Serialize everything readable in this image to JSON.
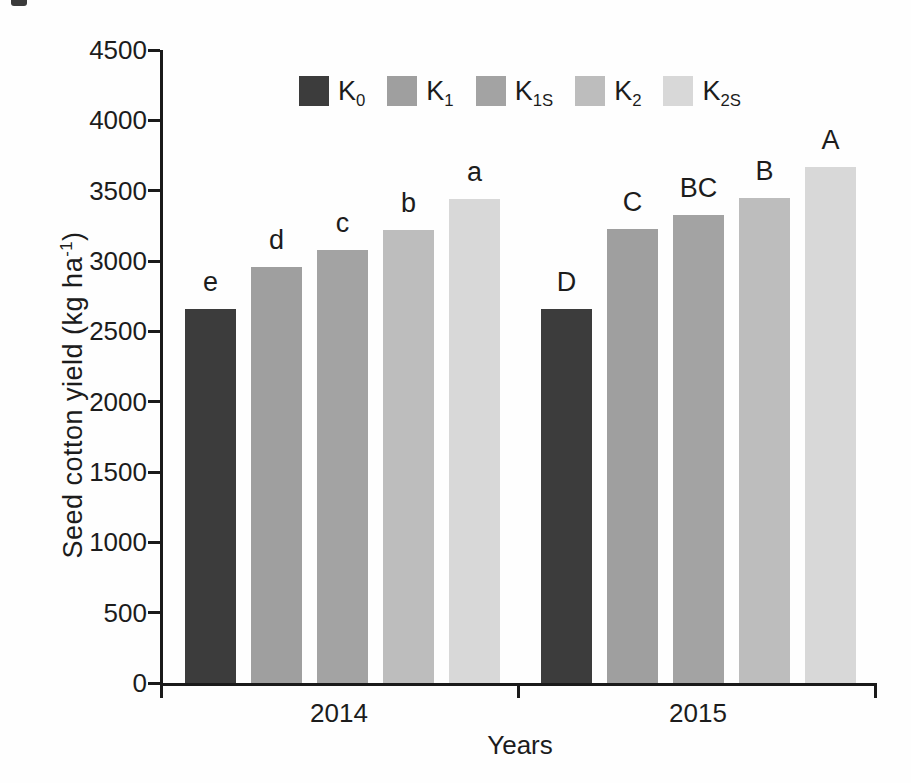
{
  "chart_data": {
    "type": "bar",
    "title": "",
    "xlabel": "Years",
    "ylabel_prefix": "Seed cotton yield (kg ha",
    "ylabel_sup": "-1",
    "ylabel_suffix": ")",
    "ylim": [
      0,
      4500
    ],
    "ytick_step": 500,
    "yticks": [
      "0",
      "500",
      "1000",
      "1500",
      "2000",
      "2500",
      "3000",
      "3500",
      "4000",
      "4500"
    ],
    "categories": [
      "2014",
      "2015"
    ],
    "grid": false,
    "legend_position": "top-center",
    "axis_color": "#1a1a1a",
    "series": [
      {
        "name": "K0",
        "legend_base": "K",
        "legend_sub": "0",
        "color": "#3c3c3c",
        "values": [
          2660,
          2660
        ],
        "sig_letters": [
          "e",
          "D"
        ]
      },
      {
        "name": "K1",
        "legend_base": "K",
        "legend_sub": "1",
        "color": "#9f9f9f",
        "values": [
          2960,
          3230
        ],
        "sig_letters": [
          "d",
          "C"
        ]
      },
      {
        "name": "K1S",
        "legend_base": "K",
        "legend_sub": "1S",
        "color": "#a3a3a3",
        "values": [
          3080,
          3330
        ],
        "sig_letters": [
          "c",
          "BC"
        ]
      },
      {
        "name": "K2",
        "legend_base": "K",
        "legend_sub": "2",
        "color": "#bdbdbd",
        "values": [
          3220,
          3450
        ],
        "sig_letters": [
          "b",
          "B"
        ]
      },
      {
        "name": "K2S",
        "legend_base": "K",
        "legend_sub": "2S",
        "color": "#d8d8d8",
        "values": [
          3440,
          3670
        ],
        "sig_letters": [
          "a",
          "A"
        ]
      }
    ]
  }
}
